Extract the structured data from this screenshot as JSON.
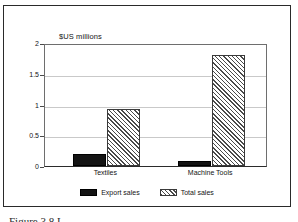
{
  "figure": {
    "caption": "Figure 3.8 L"
  },
  "chart_data": {
    "type": "bar",
    "title": "",
    "ylabel": "$US millions",
    "xlabel": "",
    "ylim": [
      0,
      2
    ],
    "yticks": [
      "0",
      "0.5",
      "1",
      "1.5",
      "2"
    ],
    "ytick_values": [
      0,
      0.5,
      1,
      1.5,
      2
    ],
    "grid": true,
    "legend_position": "bottom",
    "categories": [
      "Textiles",
      "Machine Tools"
    ],
    "series": [
      {
        "name": "Export sales",
        "fill": "solid-black",
        "color": "#141414",
        "values": [
          0.2,
          0.08
        ]
      },
      {
        "name": "Total sales",
        "fill": "diagonal-hatch",
        "color": "#4a4a4a",
        "values": [
          0.93,
          1.8
        ]
      }
    ]
  }
}
